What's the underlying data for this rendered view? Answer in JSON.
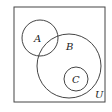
{
  "diagram": {
    "type": "venn",
    "universe_label": "U",
    "sets": [
      {
        "label": "A",
        "cx": 40,
        "cy": 38,
        "r": 18
      },
      {
        "label": "B",
        "cx": 69,
        "cy": 66,
        "r": 32
      },
      {
        "label": "C",
        "cx": 76,
        "cy": 79,
        "r": 12
      }
    ],
    "relations": "A intersects B; C is a subset of B; C is disjoint from A",
    "colors": {
      "stroke": "#444444",
      "background": "#ffffff"
    }
  }
}
